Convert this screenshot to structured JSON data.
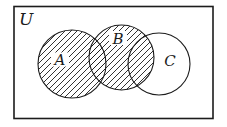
{
  "diagram": {
    "type": "venn-diagram",
    "universe": {
      "label": "U"
    },
    "sets": {
      "a": {
        "label": "A",
        "hatched": true
      },
      "b": {
        "label": "B",
        "hatched": true
      },
      "c": {
        "label": "C",
        "hatched": false
      }
    },
    "shaded_region": "A union B (diagonal hatching), including overlap of B with C",
    "colors": {
      "background": "#ffffff",
      "stroke": "#1c1c1c",
      "hatch": "#1c1c1c"
    }
  }
}
